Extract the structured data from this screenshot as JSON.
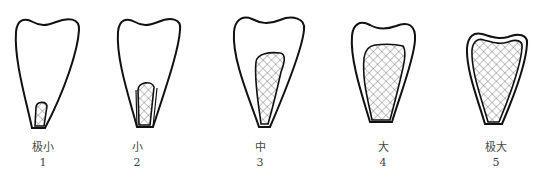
{
  "figure": {
    "stages": [
      {
        "label": "极小",
        "number": "1"
      },
      {
        "label": "小",
        "number": "2"
      },
      {
        "label": "中",
        "number": "3"
      },
      {
        "label": "大",
        "number": "4"
      },
      {
        "label": "极大",
        "number": "5"
      }
    ]
  }
}
